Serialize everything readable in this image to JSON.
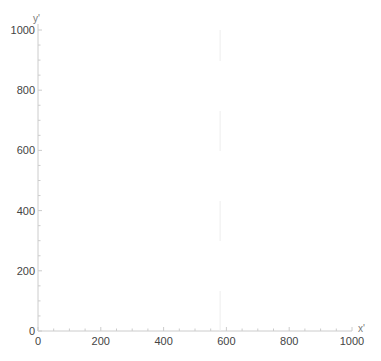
{
  "chart_data": {
    "type": "line",
    "title": "",
    "xlabel": "x'",
    "ylabel": "y'",
    "xlim": [
      0,
      1000
    ],
    "ylim": [
      0,
      1000
    ],
    "x_major_ticks": [
      0,
      200,
      400,
      600,
      800,
      1000
    ],
    "y_major_ticks": [
      0,
      200,
      400,
      600,
      800,
      1000
    ],
    "minor_tick_step": 50,
    "grid": false,
    "legend": null,
    "series": [
      {
        "name": "vertical-line",
        "x": [
          580,
          580
        ],
        "y": [
          0,
          1000
        ],
        "style": "faint dashed vertical line"
      }
    ],
    "axis_color": "#cccccc",
    "line_color": "#eeeeee"
  }
}
